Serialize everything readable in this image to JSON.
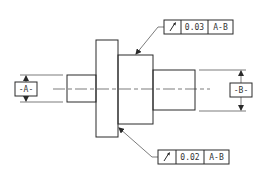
{
  "drawing": {
    "type": "GD&T circular runout callout on stepped shaft",
    "datums": [
      {
        "id": "datum-a",
        "label": "-A-"
      },
      {
        "id": "datum-b",
        "label": "-B-"
      }
    ],
    "feature_control_frames": [
      {
        "id": "fcf-top",
        "symbol": "circular-runout",
        "symbol_glyph": "↗",
        "tolerance": "0.03",
        "datum_ref": "A-B",
        "target": "hub"
      },
      {
        "id": "fcf-bottom",
        "symbol": "circular-runout",
        "symbol_glyph": "↗",
        "tolerance": "0.02",
        "datum_ref": "A-B",
        "target": "flange"
      }
    ],
    "colors": {
      "line": "#2a2a2a",
      "background": "#ffffff"
    }
  }
}
